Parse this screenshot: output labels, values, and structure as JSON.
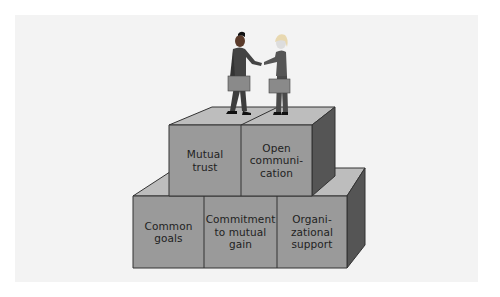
{
  "diagram": {
    "type": "block-pyramid",
    "top_figure": "two business people shaking hands, each holding a briefcase",
    "colors": {
      "background": "#ffffff",
      "panel": "#f3f3f3",
      "block_front": "#9a9a9a",
      "block_top": "#bdbdbd",
      "block_side": "#555555",
      "outline": "#333333"
    },
    "upper_tier": {
      "blocks": [
        {
          "label_lines": [
            "Mutual",
            "trust"
          ]
        },
        {
          "label_lines": [
            "Open",
            "communi-",
            "cation"
          ]
        }
      ]
    },
    "lower_tier": {
      "blocks": [
        {
          "label_lines": [
            "Common",
            "goals"
          ]
        },
        {
          "label_lines": [
            "Commitment",
            "to mutual",
            "gain"
          ]
        },
        {
          "label_lines": [
            "Organi-",
            "zational",
            "support"
          ]
        }
      ]
    }
  }
}
